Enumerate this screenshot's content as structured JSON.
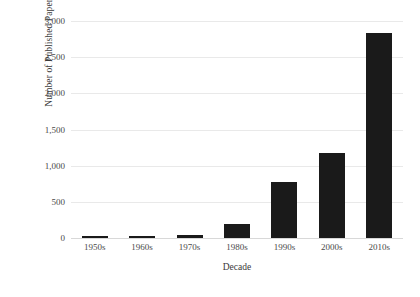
{
  "chart_data": {
    "type": "bar",
    "title": "",
    "xlabel": "Decade",
    "ylabel": "Number of Published Papers",
    "categories": [
      "1950s",
      "1960s",
      "1970s",
      "1980s",
      "1990s",
      "2000s",
      "2010s"
    ],
    "values": [
      10,
      15,
      40,
      190,
      770,
      1180,
      2830
    ],
    "series": [
      {
        "name": "Published Papers",
        "values": [
          10,
          15,
          40,
          190,
          770,
          1180,
          2830
        ]
      }
    ],
    "ylim": [
      0,
      3000
    ],
    "ytick_values": [
      0,
      500,
      1000,
      1500,
      2000,
      2500,
      3000
    ],
    "ytick_labels": [
      "0",
      "500",
      "1,000",
      "1,500",
      "2,000",
      "2,500",
      "3,000"
    ],
    "grid": true,
    "legend": false,
    "bar_color": "#1a1a1a",
    "grid_color": "#e9e9e9",
    "background_color": "#ffffff"
  }
}
